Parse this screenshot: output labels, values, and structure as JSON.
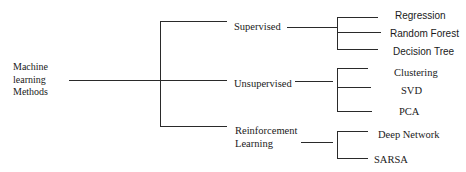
{
  "diagram": {
    "type": "tree",
    "root": {
      "label_lines": [
        "Machine",
        "learning",
        "Methods"
      ]
    },
    "categories": [
      {
        "label_lines": [
          "Supervised"
        ],
        "children": [
          "Regression",
          "Random Forest",
          "Decision Tree"
        ]
      },
      {
        "label_lines": [
          "Unsupervised"
        ],
        "children": [
          "Clustering",
          "SVD",
          "PCA"
        ]
      },
      {
        "label_lines": [
          "Reinforcement",
          "Learning"
        ],
        "children": [
          "Deep Network",
          "SARSA"
        ]
      }
    ],
    "line_color": "#2a2a2a",
    "background": "#ffffff"
  }
}
